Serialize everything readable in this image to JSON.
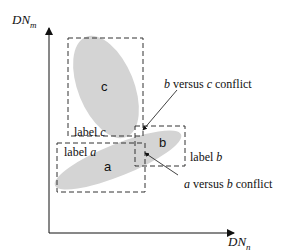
{
  "axes": {
    "y_label_main": "DN",
    "y_label_sub": "m",
    "x_label_main": "DN",
    "x_label_sub": "n"
  },
  "clusters": [
    {
      "id": "c",
      "text": "c"
    },
    {
      "id": "a",
      "text": "a"
    },
    {
      "id": "b",
      "text": "b"
    }
  ],
  "labels": {
    "label_c": {
      "prefix": "label ",
      "var": "c"
    },
    "label_a": {
      "prefix": "label ",
      "var": "a"
    },
    "label_b": {
      "prefix": "label ",
      "var": "b"
    }
  },
  "annotations": {
    "bc_conflict": {
      "v1": "b",
      "mid": " versus ",
      "v2": "c",
      "suffix": " conflict"
    },
    "ab_conflict": {
      "v1": "a",
      "mid": " versus ",
      "v2": "b",
      "suffix": " conflict"
    }
  },
  "colors": {
    "fill": "#d4d4d4",
    "line": "#333333"
  }
}
